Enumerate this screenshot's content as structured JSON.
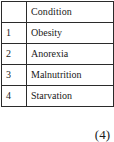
{
  "table": {
    "headers": {
      "index": "",
      "condition": "Condition"
    },
    "rows": [
      {
        "index": "1",
        "condition": "Obesity"
      },
      {
        "index": "2",
        "condition": "Anorexia"
      },
      {
        "index": "3",
        "condition": "Malnutrition"
      },
      {
        "index": "4",
        "condition": "Starvation"
      }
    ]
  },
  "caption": "(4)",
  "colors": {
    "border": "#2b2b2b",
    "text": "#1a1a1a",
    "background": "#ffffff"
  }
}
